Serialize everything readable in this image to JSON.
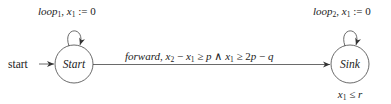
{
  "diagram": {
    "type": "automaton",
    "stroke_color": "#444444",
    "states": [
      {
        "id": "start",
        "label": "Start",
        "initial": true,
        "invariant": ""
      },
      {
        "id": "sink",
        "label": "Sink",
        "initial": false,
        "invariant": "x₁ ≤ r"
      }
    ],
    "initial_label": "start",
    "transitions": [
      {
        "from": "start",
        "to": "start",
        "label": "loop₁, x₁ := 0",
        "action": "loop",
        "action_sub": "1",
        "var": "x",
        "var_sub": "1",
        "reset": " := 0"
      },
      {
        "from": "start",
        "to": "sink",
        "label": "forward, x₂ − x₁ ≥ p ∧ x₁ ≥ 2p − q"
      },
      {
        "from": "sink",
        "to": "sink",
        "label": "loop₂, x₁ := 0",
        "action": "loop",
        "action_sub": "2",
        "var": "x",
        "var_sub": "1",
        "reset": " := 0"
      }
    ]
  }
}
